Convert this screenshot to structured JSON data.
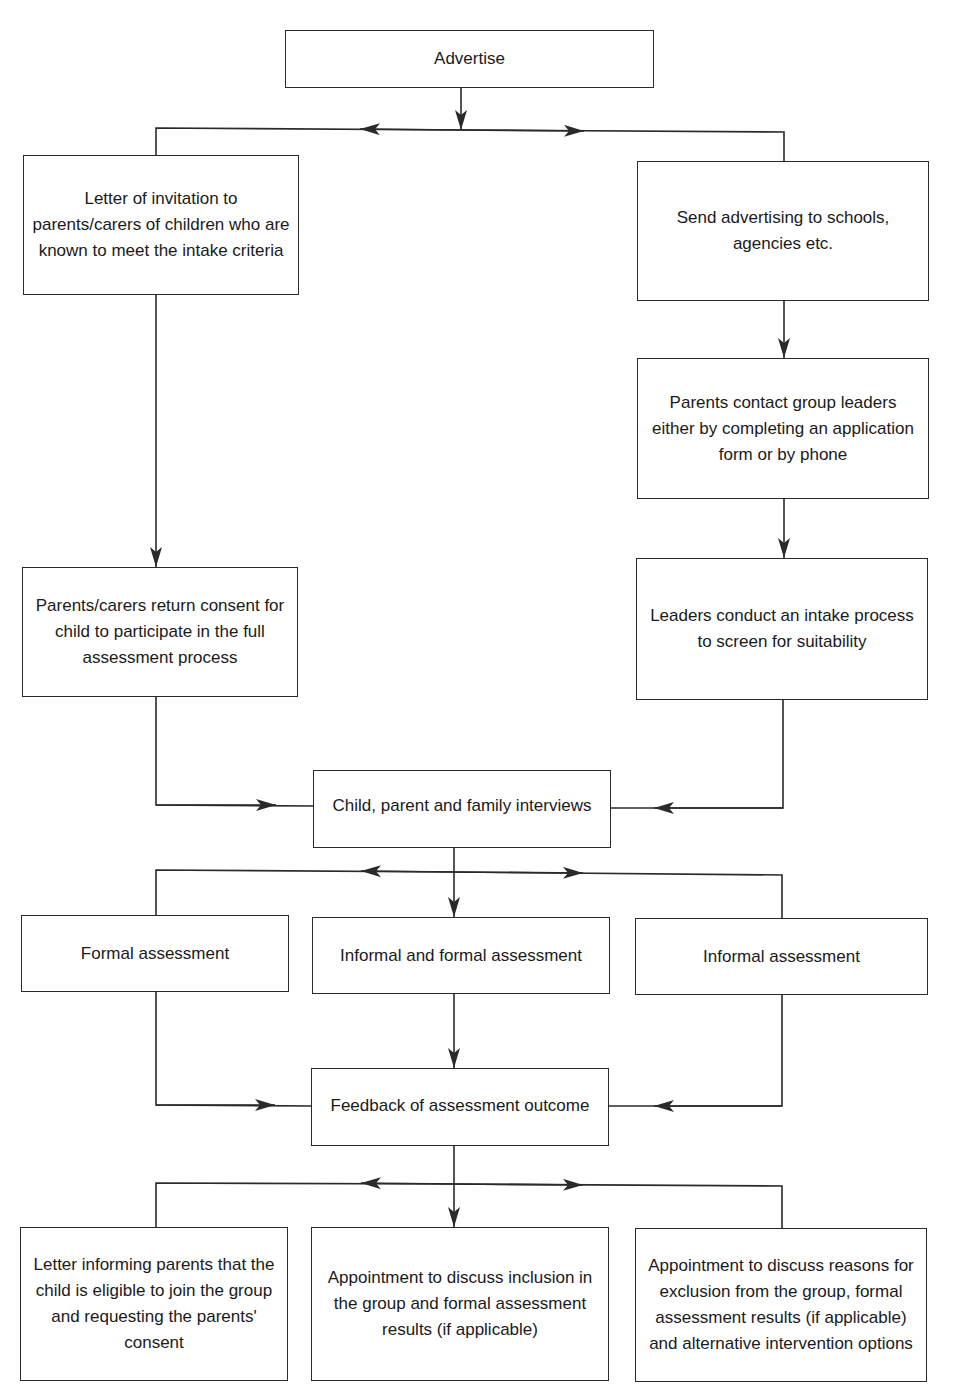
{
  "diagram": {
    "type": "flowchart",
    "nodes": {
      "advertise": "Advertise",
      "letter_invitation": "Letter of invitation to parents/carers of children who are known to meet the intake criteria",
      "send_advertising": "Send advertising to schools, agencies etc.",
      "parents_contact": "Parents contact group leaders either by completing an application form or by phone",
      "return_consent": "Parents/carers return consent for child to participate in the full assessment process",
      "leaders_intake": "Leaders conduct an intake process to screen for suitability",
      "interviews": "Child, parent and family interviews",
      "formal_assessment": "Formal assessment",
      "informal_formal_assessment": "Informal and formal assessment",
      "informal_assessment": "Informal assessment",
      "feedback": "Feedback of assessment outcome",
      "letter_eligible": "Letter informing parents that the child is eligible to join the group and requesting the parents' consent",
      "appointment_inclusion": "Appointment to discuss inclusion in the group and formal assessment results (if applicable)",
      "appointment_exclusion": "Appointment to discuss reasons for exclusion from the group, formal assessment results (if applicable) and alternative intervention options"
    },
    "edges": [
      [
        "advertise",
        "letter_invitation"
      ],
      [
        "advertise",
        "send_advertising"
      ],
      [
        "letter_invitation",
        "return_consent"
      ],
      [
        "send_advertising",
        "parents_contact"
      ],
      [
        "parents_contact",
        "leaders_intake"
      ],
      [
        "return_consent",
        "interviews"
      ],
      [
        "leaders_intake",
        "interviews"
      ],
      [
        "interviews",
        "formal_assessment"
      ],
      [
        "interviews",
        "informal_formal_assessment"
      ],
      [
        "interviews",
        "informal_assessment"
      ],
      [
        "formal_assessment",
        "feedback"
      ],
      [
        "informal_formal_assessment",
        "feedback"
      ],
      [
        "informal_assessment",
        "feedback"
      ],
      [
        "feedback",
        "letter_eligible"
      ],
      [
        "feedback",
        "appointment_inclusion"
      ],
      [
        "feedback",
        "appointment_exclusion"
      ]
    ]
  }
}
